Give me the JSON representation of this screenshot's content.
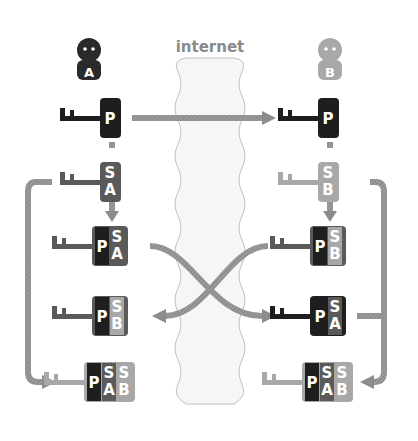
{
  "title": "internet",
  "colors": {
    "dark": "#1e1e1e",
    "mid": "#5a5a5a",
    "light": "#a8a8a8",
    "arrow": "#8c8c8c",
    "cloud_fill": "#f6f6f6",
    "cloud_stroke": "#bdbdbd",
    "label": "#8a8a8a"
  },
  "persons": [
    {
      "id": "A",
      "label": "A",
      "color": "dark"
    },
    {
      "id": "B",
      "label": "B",
      "color": "light"
    }
  ],
  "keys": {
    "left": [
      {
        "row": 1,
        "segments": [
          {
            "text": "P",
            "color": "dark"
          }
        ],
        "key_color": "dark"
      },
      {
        "row": 2,
        "segments": [
          {
            "text": "S\nA",
            "color": "mid"
          }
        ],
        "key_color": "mid"
      },
      {
        "row": 3,
        "segments": [
          {
            "text": "P",
            "color": "dark"
          },
          {
            "text": "S\nA",
            "color": "mid"
          }
        ],
        "key_color": "mid"
      },
      {
        "row": 4,
        "segments": [
          {
            "text": "P",
            "color": "dark"
          },
          {
            "text": "S\nB",
            "color": "light"
          }
        ],
        "key_color": "mid"
      },
      {
        "row": 5,
        "segments": [
          {
            "text": "P",
            "color": "dark"
          },
          {
            "text": "S\nA",
            "color": "mid"
          },
          {
            "text": "S\nB",
            "color": "light"
          }
        ],
        "key_color": "light"
      }
    ],
    "right": [
      {
        "row": 1,
        "segments": [
          {
            "text": "P",
            "color": "dark"
          }
        ],
        "key_color": "dark"
      },
      {
        "row": 2,
        "segments": [
          {
            "text": "S\nB",
            "color": "light"
          }
        ],
        "key_color": "light"
      },
      {
        "row": 3,
        "segments": [
          {
            "text": "P",
            "color": "dark"
          },
          {
            "text": "S\nB",
            "color": "light"
          }
        ],
        "key_color": "mid"
      },
      {
        "row": 4,
        "segments": [
          {
            "text": "P",
            "color": "dark"
          },
          {
            "text": "S\nA",
            "color": "mid"
          }
        ],
        "key_color": "dark"
      },
      {
        "row": 5,
        "segments": [
          {
            "text": "P",
            "color": "dark"
          },
          {
            "text": "S\nA",
            "color": "mid"
          },
          {
            "text": "S\nB",
            "color": "light"
          }
        ],
        "key_color": "light"
      }
    ]
  },
  "glyphs": {
    "P": "P",
    "S": "S",
    "A": "A",
    "B": "B"
  }
}
